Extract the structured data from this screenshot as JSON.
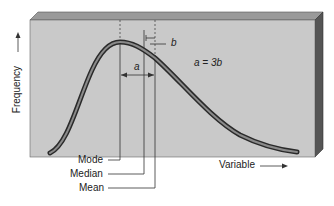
{
  "diagram": {
    "y_axis_label": "Frequency",
    "x_axis_label": "Variable",
    "markers": [
      {
        "label": "Mode"
      },
      {
        "label": "Median"
      },
      {
        "label": "Mean"
      }
    ],
    "distance_a": "a",
    "distance_b": "b",
    "relation": "a = 3b",
    "colors": {
      "panel_face": "#c9c9c9",
      "panel_top": "#9a9a9a",
      "panel_side": "#555555",
      "curve_outer": "#2a2a2a",
      "curve_inner": "#8a8a8a"
    }
  }
}
